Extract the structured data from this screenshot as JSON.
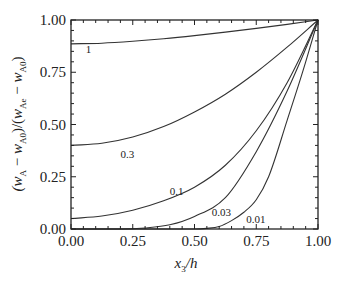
{
  "chart_data": {
    "type": "line",
    "title": "",
    "xlabel": "x_3/h",
    "ylabel": "(w_A − w_A0)/(w_Ae − w_A0)",
    "xlim": [
      0,
      1
    ],
    "ylim": [
      0,
      1
    ],
    "grid": false,
    "legend": "inline curve labels",
    "x_ticks": [
      "0.00",
      "0.25",
      "0.50",
      "0.75",
      "1.00"
    ],
    "y_ticks": [
      "0.00",
      "0.25",
      "0.50",
      "0.75",
      "1.00"
    ],
    "series": [
      {
        "name": "1",
        "label_pos": [
          0.06,
          0.84
        ],
        "x": [
          0,
          0.125,
          0.25,
          0.375,
          0.5,
          0.625,
          0.75,
          0.875,
          1.0
        ],
        "y": [
          0.886,
          0.889,
          0.898,
          0.91,
          0.925,
          0.942,
          0.96,
          0.979,
          1.0
        ]
      },
      {
        "name": "0.3",
        "label_pos": [
          0.2,
          0.34
        ],
        "x": [
          0,
          0.125,
          0.25,
          0.375,
          0.5,
          0.625,
          0.75,
          0.875,
          1.0
        ],
        "y": [
          0.4,
          0.41,
          0.44,
          0.49,
          0.56,
          0.645,
          0.75,
          0.87,
          1.0
        ]
      },
      {
        "name": "0.1",
        "label_pos": [
          0.4,
          0.165
        ],
        "x": [
          0,
          0.125,
          0.25,
          0.375,
          0.5,
          0.625,
          0.75,
          0.875,
          1.0
        ],
        "y": [
          0.05,
          0.062,
          0.09,
          0.135,
          0.2,
          0.305,
          0.47,
          0.7,
          1.0
        ]
      },
      {
        "name": "0.03",
        "label_pos": [
          0.57,
          0.06
        ],
        "x": [
          0,
          0.2,
          0.3,
          0.4,
          0.5,
          0.625,
          0.75,
          0.875,
          1.0
        ],
        "y": [
          0.0,
          0.0,
          0.005,
          0.02,
          0.06,
          0.15,
          0.37,
          0.66,
          1.0
        ]
      },
      {
        "name": "0.01",
        "label_pos": [
          0.71,
          0.03
        ],
        "x": [
          0,
          0.5,
          0.55,
          0.6,
          0.65,
          0.7,
          0.75,
          0.8,
          0.875,
          0.94,
          1.0
        ],
        "y": [
          0.0,
          0.0,
          0.003,
          0.012,
          0.04,
          0.08,
          0.14,
          0.25,
          0.52,
          0.76,
          1.0
        ]
      }
    ]
  }
}
